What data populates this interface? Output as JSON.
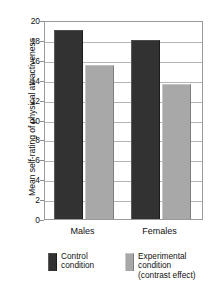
{
  "chart_data": {
    "type": "bar",
    "title": "",
    "xlabel": "",
    "ylabel": "Mean self-rating of physical attractiveness",
    "categories": [
      "Males",
      "Females"
    ],
    "series": [
      {
        "name": "Control condition",
        "values": [
          19.0,
          18.0
        ],
        "color": "#323232"
      },
      {
        "name": "Experimental condition (contrast effect)",
        "values": [
          15.5,
          13.6
        ],
        "color": "#a8a8a8"
      }
    ],
    "ylim": [
      0,
      20
    ],
    "ytick_values": [
      20,
      18,
      16,
      14,
      12,
      10,
      8,
      6,
      4,
      2,
      0
    ],
    "ytick_labels": [
      "20",
      "18",
      "16",
      "14",
      "12",
      "10",
      "8",
      "6",
      "4",
      "2",
      "0"
    ],
    "grid": "horizontal",
    "legend_position": "bottom"
  },
  "legend": {
    "entries": [
      {
        "swatch": "control",
        "lines": [
          "Control",
          "condition"
        ]
      },
      {
        "swatch": "experimental",
        "lines": [
          "Experimental",
          "condition",
          "(contrast effect)"
        ]
      }
    ]
  }
}
